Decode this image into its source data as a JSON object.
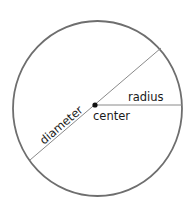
{
  "diagram": {
    "labels": {
      "radius": "radius",
      "center": "center",
      "diameter": "diameter"
    },
    "colors": {
      "circle_stroke": "#6e6e6e",
      "line_stroke": "#8a8a8a",
      "center_dot": "#111111",
      "text": "#1a1a1a"
    }
  }
}
